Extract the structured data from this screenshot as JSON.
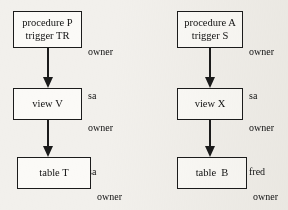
{
  "diagram": {
    "background_color": "#f2f0ec",
    "line_color": "#1b1b1b",
    "columns": [
      {
        "id": "left-chain",
        "nodes": [
          {
            "id": "procedure-p",
            "line1": "procedure P",
            "line2": "trigger TR",
            "owner_label": "owner",
            "owner_value": "sa"
          },
          {
            "id": "view-v",
            "line1": "view V",
            "line2": "",
            "owner_label": "owner",
            "owner_value": "sa"
          },
          {
            "id": "table-t",
            "line1": "table T",
            "line2": "",
            "owner_label": "owner",
            "owner_value": "sa"
          }
        ],
        "arrows": [
          {
            "id": "arrow-p-to-v",
            "from": "procedure-p",
            "to": "view-v"
          },
          {
            "id": "arrow-v-to-t",
            "from": "view-v",
            "to": "table-t"
          }
        ]
      },
      {
        "id": "right-chain",
        "nodes": [
          {
            "id": "procedure-a",
            "line1": "procedure A",
            "line2": "trigger S",
            "owner_label": "owner",
            "owner_value": "sa"
          },
          {
            "id": "view-x",
            "line1": "view X",
            "line2": "",
            "owner_label": "owner",
            "owner_value": "fred"
          },
          {
            "id": "table-b",
            "line1": "table  B",
            "line2": "",
            "owner_label": "owner",
            "owner_value": "sa"
          }
        ],
        "arrows": [
          {
            "id": "arrow-a-to-x",
            "from": "procedure-a",
            "to": "view-x"
          },
          {
            "id": "arrow-x-to-b",
            "from": "view-x",
            "to": "table-b"
          }
        ]
      }
    ]
  }
}
